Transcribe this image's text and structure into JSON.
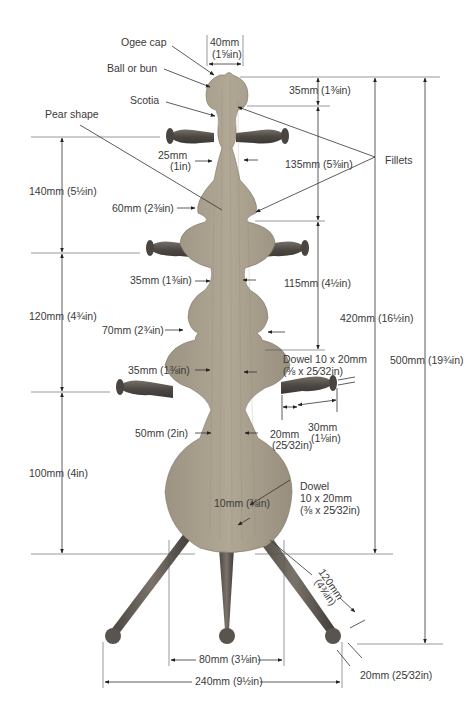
{
  "diagram": {
    "part_labels": {
      "ogee_cap": "Ogee cap",
      "ball_or_bun": "Ball or bun",
      "scotia": "Scotia",
      "pear_shape": "Pear shape",
      "fillets": "Fillets"
    },
    "dimensions": {
      "top_width": {
        "mm": "40mm",
        "in": "(1⅝in)"
      },
      "cap_height": "35mm (1⅜in)",
      "upper_section": "135mm (5⅜in)",
      "middle_section": "115mm (4½in)",
      "column_total": "420mm (16½in)",
      "overall_height": "500mm (19¾in)",
      "left_140": "140mm (5½in)",
      "left_120": "120mm (4¾in)",
      "left_100": "100mm (4in)",
      "neck_25": {
        "mm": "25mm",
        "in": "(1in)"
      },
      "width_60": "60mm (2⅜in)",
      "neck_35_a": "35mm (1⅜in)",
      "width_70": "70mm (2¾in)",
      "neck_35_b": "35mm (1⅜in)",
      "neck_50": "50mm (2in)",
      "peg_dowel": {
        "line1": "Dowel 10 x 20mm",
        "line2": "(⅜ x 25⁄32in)"
      },
      "peg_20": {
        "mm": "20mm",
        "in": "(25⁄32in)"
      },
      "peg_30": {
        "mm": "30mm",
        "in": "(1⅛in)"
      },
      "leg_dowel": {
        "line1": "Dowel",
        "line2": "10 x 20mm",
        "line3": "(⅜ x 25⁄32in)"
      },
      "leg_dowel_dia": "10mm (⅜in)",
      "leg_length": {
        "mm": "120mm",
        "in": "(4¾in)"
      },
      "foot_ball": "20mm (25⁄32in)",
      "inner_leg_spread": "80mm (3⅛in)",
      "outer_leg_spread": "240mm (9½in)"
    },
    "colors": {
      "wood": "#a39a88",
      "wood_dark": "#8a8070",
      "peg": "#5a5550",
      "line": "#333333"
    }
  }
}
